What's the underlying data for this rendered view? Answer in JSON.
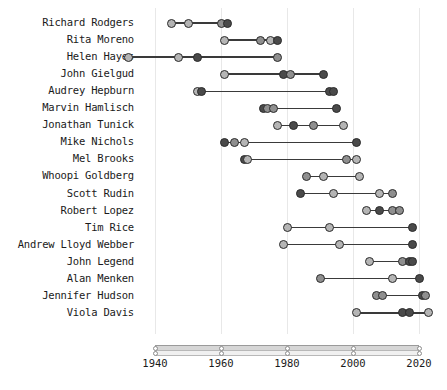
{
  "chart_data": {
    "type": "scatter",
    "title": "",
    "subtitle": "",
    "xlabel": "",
    "ylabel": "",
    "xlim": [
      1940,
      2020
    ],
    "xticks": [
      1940,
      1960,
      1980,
      2000,
      2020
    ],
    "xticklabels": [
      "1940",
      "1960",
      "1980",
      "2000",
      "2020"
    ],
    "grid": true,
    "legend": "none",
    "orientation": "horizontal-dumbbell",
    "categories": [
      "Richard Rodgers",
      "Rita Moreno",
      "Helen Hayes",
      "John Gielgud",
      "Audrey Hepburn",
      "Marvin Hamlisch",
      "Jonathan Tunick",
      "Mike Nichols",
      "Mel Brooks",
      "Whoopi Goldberg",
      "Scott Rudin",
      "Robert Lopez",
      "Tim Rice",
      "Andrew Lloyd Webber",
      "John Legend",
      "Alan Menken",
      "Jennifer Hudson",
      "Viola Davis"
    ],
    "rows": [
      {
        "name": "Richard Rodgers",
        "points": [
          1945,
          1950,
          1960,
          1962
        ],
        "shades": [
          "light",
          "light",
          "mid",
          "dark"
        ]
      },
      {
        "name": "Rita Moreno",
        "points": [
          1961,
          1972,
          1975,
          1977
        ],
        "shades": [
          "light",
          "mid",
          "light",
          "dark"
        ]
      },
      {
        "name": "Helen Hayes",
        "points": [
          1932,
          1947,
          1953,
          1977
        ],
        "shades": [
          "light",
          "light",
          "dark",
          "mid"
        ]
      },
      {
        "name": "John Gielgud",
        "points": [
          1961,
          1979,
          1981,
          1991
        ],
        "shades": [
          "light",
          "dark",
          "mid",
          "dark"
        ]
      },
      {
        "name": "Audrey Hepburn",
        "points": [
          1953,
          1954,
          1993,
          1994
        ],
        "shades": [
          "light",
          "dark",
          "dark",
          "dark"
        ]
      },
      {
        "name": "Marvin Hamlisch",
        "points": [
          1973,
          1974,
          1976,
          1995
        ],
        "shades": [
          "dark",
          "mid",
          "mid",
          "dark"
        ]
      },
      {
        "name": "Jonathan Tunick",
        "points": [
          1977,
          1982,
          1988,
          1997
        ],
        "shades": [
          "light",
          "dark",
          "mid",
          "light"
        ]
      },
      {
        "name": "Mike Nichols",
        "points": [
          1961,
          1964,
          1967,
          2001
        ],
        "shades": [
          "dark",
          "mid",
          "light",
          "dark"
        ]
      },
      {
        "name": "Mel Brooks",
        "points": [
          1967,
          1968,
          1998,
          2001
        ],
        "shades": [
          "dark",
          "light",
          "mid",
          "light"
        ]
      },
      {
        "name": "Whoopi Goldberg",
        "points": [
          1986,
          1991,
          2002
        ],
        "shades": [
          "mid",
          "light",
          "light"
        ]
      },
      {
        "name": "Scott Rudin",
        "points": [
          1984,
          1994,
          2008,
          2012
        ],
        "shades": [
          "dark",
          "light",
          "light",
          "mid"
        ]
      },
      {
        "name": "Robert Lopez",
        "points": [
          2004,
          2008,
          2012,
          2014
        ],
        "shades": [
          "light",
          "dark",
          "mid",
          "mid"
        ]
      },
      {
        "name": "Tim Rice",
        "points": [
          1980,
          1993,
          2018
        ],
        "shades": [
          "light",
          "light",
          "dark"
        ]
      },
      {
        "name": "Andrew Lloyd Webber",
        "points": [
          1979,
          1996,
          2018
        ],
        "shades": [
          "light",
          "light",
          "dark"
        ]
      },
      {
        "name": "John Legend",
        "points": [
          2005,
          2015,
          2017,
          2018
        ],
        "shades": [
          "light",
          "mid",
          "dark",
          "dark"
        ]
      },
      {
        "name": "Alan Menken",
        "points": [
          1990,
          2012,
          2020
        ],
        "shades": [
          "mid",
          "light",
          "dark"
        ]
      },
      {
        "name": "Jennifer Hudson",
        "points": [
          2007,
          2009,
          2021,
          2022
        ],
        "shades": [
          "mid",
          "mid",
          "dark",
          "mid"
        ]
      },
      {
        "name": "Viola Davis",
        "points": [
          2001,
          2015,
          2017,
          2023
        ],
        "shades": [
          "light",
          "dark",
          "dark",
          "light"
        ]
      }
    ]
  },
  "colors": {
    "light": "#b5b5b5",
    "mid": "#8f8f8f",
    "dark": "#4a4a4a",
    "line": "#3a3a3a",
    "grid": "#e8e8e8",
    "text": "#1a1a1a",
    "axis_bar": "#d6d6d6"
  }
}
